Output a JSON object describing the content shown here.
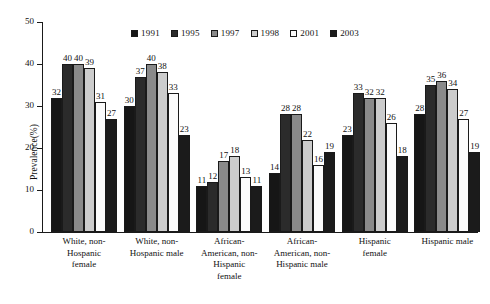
{
  "chart_data": {
    "type": "bar",
    "title": "",
    "subtitle": "",
    "xlabel": "",
    "ylabel": "Prevalence(%)",
    "ylim": [
      0,
      50
    ],
    "yticks": [
      0,
      10,
      20,
      30,
      40,
      50
    ],
    "grid": false,
    "legend_position": "top-center",
    "categories": [
      "White, non-Hospanic female",
      "White, non-Hospanic male",
      "African-American, non-Hispanic female",
      "African-American, non-Hispanic male",
      "Hispanic female",
      "Hispanic male"
    ],
    "category_lines": [
      [
        "White, non-",
        "Hospanic",
        "female"
      ],
      [
        "White, non-",
        "Hospanic male"
      ],
      [
        "African-",
        "American, non-",
        "Hispanic",
        "female"
      ],
      [
        "African-",
        "American, non-",
        "Hispanic male"
      ],
      [
        "Hispanic",
        "female"
      ],
      [
        "Hispanic male"
      ]
    ],
    "series": [
      {
        "name": "1991",
        "color": "#161616",
        "values": [
          32,
          30,
          11,
          14,
          23,
          28
        ]
      },
      {
        "name": "1995",
        "color": "#2b2b2b",
        "values": [
          40,
          37,
          12,
          28,
          33,
          35
        ]
      },
      {
        "name": "1997",
        "color": "#8a8a8a",
        "values": [
          40,
          40,
          17,
          28,
          32,
          36
        ]
      },
      {
        "name": "1998",
        "color": "#cccccc",
        "values": [
          39,
          38,
          18,
          22,
          32,
          34
        ]
      },
      {
        "name": "2001",
        "color": "#fbfbfb",
        "values": [
          31,
          33,
          13,
          16,
          26,
          27
        ]
      },
      {
        "name": "2003",
        "color": "#1b1b1b",
        "values": [
          27,
          23,
          11,
          19,
          18,
          19
        ]
      }
    ]
  }
}
